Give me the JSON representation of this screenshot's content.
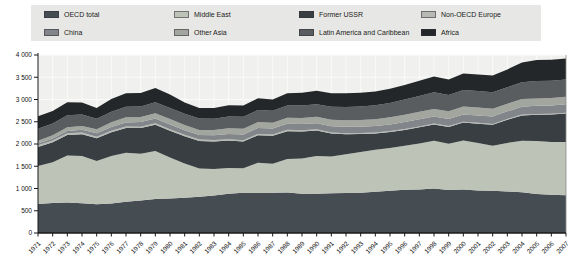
{
  "figure": {
    "title": "",
    "background_color": "#ffffff"
  },
  "colors": {
    "legend_background": "#e7e8e5",
    "plot_background": "#f0f0ee",
    "gridline": "#fbfbf9",
    "axis": "#1a1a1a",
    "tick_label": "#111111",
    "plot_right_border": "#8a8a88"
  },
  "chart_data": {
    "type": "area",
    "stacked": true,
    "title": "",
    "xlabel": "",
    "ylabel": "",
    "grid": true,
    "legend_position": "top",
    "ylim": [
      0,
      4000
    ],
    "y_ticks": [
      0,
      500,
      1000,
      1500,
      2000,
      2500,
      3000,
      3500,
      4000
    ],
    "y_tick_labels": [
      "0",
      "500",
      "1 000",
      "1 500",
      "2 000",
      "2 500",
      "3 000",
      "3 500",
      "4 000"
    ],
    "x": [
      1971,
      1972,
      1973,
      1974,
      1975,
      1976,
      1977,
      1978,
      1979,
      1980,
      1981,
      1982,
      1983,
      1984,
      1985,
      1986,
      1987,
      1988,
      1989,
      1990,
      1991,
      1992,
      1993,
      1994,
      1995,
      1996,
      1997,
      1998,
      1999,
      2000,
      2001,
      2002,
      2003,
      2004,
      2005,
      2006,
      2007
    ],
    "series": [
      {
        "name": "OECD total",
        "color": "#454c52",
        "values": [
          650,
          672,
          685,
          668,
          645,
          662,
          700,
          732,
          762,
          775,
          792,
          812,
          842,
          882,
          902,
          900,
          902,
          912,
          882,
          882,
          892,
          897,
          902,
          927,
          947,
          972,
          977,
          1000,
          965,
          975,
          955,
          950,
          935,
          915,
          875,
          860,
          850
        ]
      },
      {
        "name": "Middle East",
        "color": "#bec3b8",
        "values": [
          855,
          920,
          1055,
          1065,
          975,
          1070,
          1105,
          1050,
          1080,
          920,
          770,
          640,
          595,
          580,
          555,
          680,
          655,
          750,
          790,
          850,
          825,
          870,
          920,
          945,
          965,
          990,
          1035,
          1075,
          1040,
          1105,
          1070,
          1010,
          1090,
          1160,
          1190,
          1185,
          1195
        ]
      },
      {
        "name": "Former USSR",
        "color": "#383e42",
        "values": [
          430,
          450,
          465,
          488,
          510,
          530,
          552,
          575,
          590,
          605,
          612,
          616,
          620,
          615,
          600,
          617,
          627,
          627,
          610,
          572,
          517,
          452,
          400,
          362,
          356,
          353,
          362,
          363,
          378,
          402,
          432,
          472,
          520,
          568,
          592,
          618,
          642
        ]
      },
      {
        "name": "Non-OECD Europe",
        "color": "#b6bab3",
        "values": [
          35,
          35,
          35,
          35,
          34,
          34,
          34,
          33,
          33,
          33,
          32,
          32,
          31,
          31,
          30,
          30,
          29,
          29,
          28,
          27,
          25,
          24,
          23,
          22,
          22,
          21,
          21,
          21,
          20,
          20,
          20,
          20,
          19,
          19,
          19,
          18,
          18
        ]
      },
      {
        "name": "China",
        "color": "#82868a",
        "values": [
          40,
          45,
          54,
          65,
          77,
          87,
          94,
          104,
          106,
          106,
          101,
          102,
          106,
          114,
          125,
          131,
          134,
          137,
          138,
          138,
          141,
          142,
          145,
          146,
          150,
          157,
          160,
          161,
          160,
          163,
          165,
          167,
          170,
          175,
          181,
          184,
          187
        ]
      },
      {
        "name": "Other Asia",
        "color": "#a2a69f",
        "values": [
          65,
          75,
          85,
          85,
          90,
          105,
          115,
          115,
          120,
          120,
          120,
          115,
          120,
          130,
          130,
          135,
          130,
          135,
          138,
          142,
          146,
          150,
          152,
          156,
          160,
          165,
          168,
          168,
          172,
          176,
          176,
          175,
          172,
          172,
          168,
          166,
          170
        ]
      },
      {
        "name": "Latin America and Caribbean",
        "color": "#595d60",
        "values": [
          270,
          262,
          265,
          255,
          235,
          235,
          235,
          235,
          250,
          252,
          255,
          255,
          255,
          265,
          268,
          272,
          268,
          276,
          278,
          282,
          290,
          296,
          302,
          312,
          322,
          342,
          358,
          375,
          365,
          372,
          372,
          368,
          368,
          378,
          388,
          388,
          385
        ]
      },
      {
        "name": "Africa",
        "color": "#242729",
        "values": [
          280,
          285,
          292,
          270,
          245,
          290,
          305,
          300,
          320,
          300,
          250,
          237,
          240,
          252,
          257,
          262,
          257,
          272,
          285,
          302,
          307,
          307,
          307,
          312,
          317,
          327,
          342,
          352,
          352,
          372,
          372,
          377,
          402,
          442,
          472,
          477,
          475
        ]
      }
    ]
  }
}
